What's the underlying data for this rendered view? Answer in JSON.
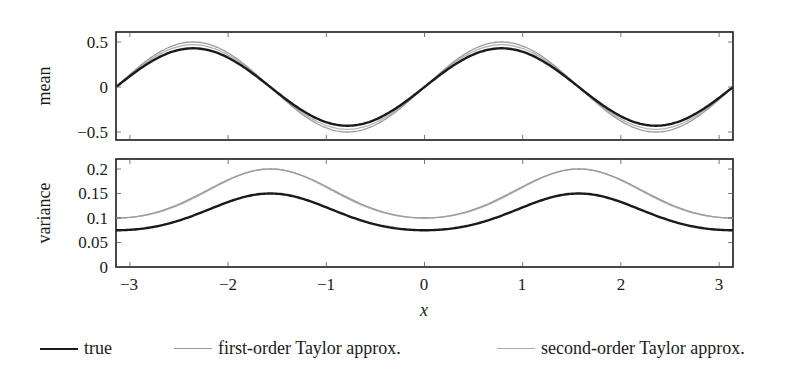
{
  "chart_data": [
    {
      "type": "line",
      "title": "",
      "xlabel": "",
      "ylabel": "mean",
      "xlim": [
        -3.14159,
        3.14159
      ],
      "ylim": [
        -0.6,
        0.6
      ],
      "yticks": [
        0.5,
        0,
        -0.5
      ],
      "ytick_labels": [
        "0.5",
        "0",
        "−0.5"
      ],
      "xticks": [
        -3,
        -2,
        -1,
        0,
        1,
        2,
        3
      ],
      "grid": false,
      "series": [
        {
          "name": "true",
          "color": "#1a1a1a",
          "formula": "0.43*sin(2x)",
          "x": [
            -3.14,
            -2.36,
            -1.57,
            -0.79,
            0,
            0.79,
            1.57,
            2.36,
            3.14
          ],
          "values": [
            0,
            0.43,
            0,
            -0.43,
            0,
            0.43,
            0,
            -0.43,
            0
          ]
        },
        {
          "name": "first-order Taylor approx.",
          "color": "#999999",
          "formula": "0.5*sin(2x)",
          "x": [
            -3.14,
            -2.36,
            -1.57,
            -0.79,
            0,
            0.79,
            1.57,
            2.36,
            3.14
          ],
          "values": [
            0,
            0.5,
            0,
            -0.5,
            0,
            0.5,
            0,
            -0.5,
            0
          ]
        },
        {
          "name": "second-order Taylor approx.",
          "color": "#aaaaaa",
          "formula": "0.47*sin(2x)",
          "x": [
            -3.14,
            -2.36,
            -1.57,
            -0.79,
            0,
            0.79,
            1.57,
            2.36,
            3.14
          ],
          "values": [
            0,
            0.47,
            0,
            -0.47,
            0,
            0.47,
            0,
            -0.47,
            0
          ]
        }
      ]
    },
    {
      "type": "line",
      "title": "",
      "xlabel": "x",
      "ylabel": "variance",
      "xlim": [
        -3.14159,
        3.14159
      ],
      "ylim": [
        0,
        0.22
      ],
      "yticks": [
        0,
        0.05,
        0.1,
        0.15,
        0.2
      ],
      "ytick_labels": [
        "0",
        "0.05",
        "0.1",
        "0.15",
        "0.2"
      ],
      "xticks": [
        -3,
        -2,
        -1,
        0,
        1,
        2,
        3
      ],
      "xtick_labels": [
        "−3",
        "−2",
        "−1",
        "0",
        "1",
        "2",
        "3"
      ],
      "grid": false,
      "series": [
        {
          "name": "true",
          "color": "#1a1a1a",
          "x": [
            -3.14,
            -2.6,
            -1.57,
            -0.6,
            0,
            0.6,
            1.57,
            2.6,
            3.14
          ],
          "values": [
            0.075,
            0.06,
            0.15,
            0.06,
            0.075,
            0.06,
            0.15,
            0.06,
            0.075
          ]
        },
        {
          "name": "first-order Taylor approx.",
          "color": "#999999",
          "x": [
            -3.14,
            -2.6,
            -1.57,
            -0.6,
            0,
            0.6,
            1.57,
            2.6,
            3.14
          ],
          "values": [
            0.1,
            0.065,
            0.2,
            0.065,
            0.1,
            0.065,
            0.2,
            0.065,
            0.1
          ]
        },
        {
          "name": "second-order Taylor approx.",
          "color": "#aaaaaa",
          "x": [
            -3.14,
            -2.6,
            -1.57,
            -0.6,
            0,
            0.6,
            1.57,
            2.6,
            3.14
          ],
          "values": [
            0.1,
            0.078,
            0.2,
            0.078,
            0.1,
            0.078,
            0.2,
            0.078,
            0.1
          ]
        }
      ]
    }
  ],
  "axes": {
    "top": {
      "ylabel": "mean",
      "yticks": [
        "0.5",
        "0",
        "−0.5"
      ]
    },
    "bottom": {
      "ylabel": "variance",
      "yticks": [
        "0.2",
        "0.15",
        "0.1",
        "0.05",
        "0"
      ],
      "xticks": [
        "−3",
        "−2",
        "−1",
        "0",
        "1",
        "2",
        "3"
      ],
      "xlabel": "x"
    }
  },
  "legend": {
    "items": [
      {
        "label": "true",
        "color": "#1a1a1a"
      },
      {
        "label": "first-order Taylor approx.",
        "color": "#999999"
      },
      {
        "label": "second-order Taylor approx.",
        "color": "#aaaaaa"
      }
    ]
  }
}
